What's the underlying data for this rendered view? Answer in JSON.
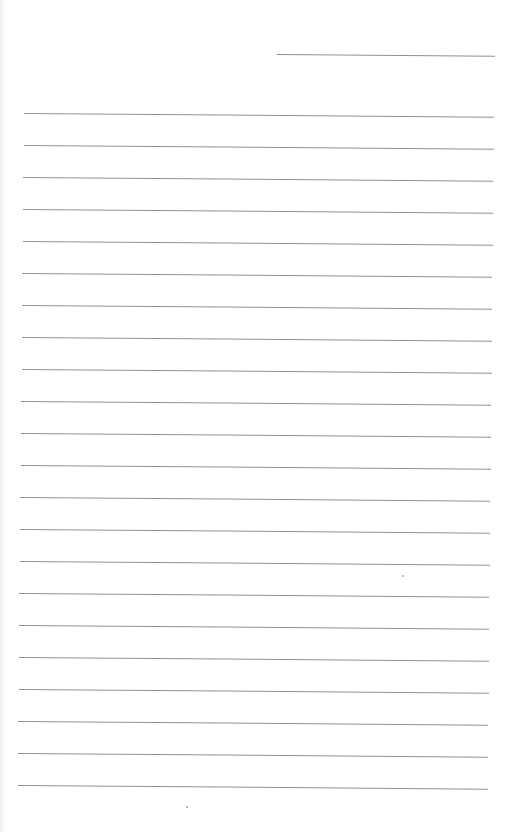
{
  "page": {
    "type": "blank-lined-sheet",
    "background": "#ffffff",
    "rule_color": "#8f8f8f",
    "header_rule": {
      "x1": 277,
      "x2": 495,
      "y": 54
    },
    "body_rules": {
      "x1": 24,
      "x2": 494,
      "first_y": 113,
      "spacing": 32,
      "count": 22
    },
    "specks": [
      {
        "x": 402,
        "y": 575
      },
      {
        "x": 186,
        "y": 806
      }
    ]
  }
}
